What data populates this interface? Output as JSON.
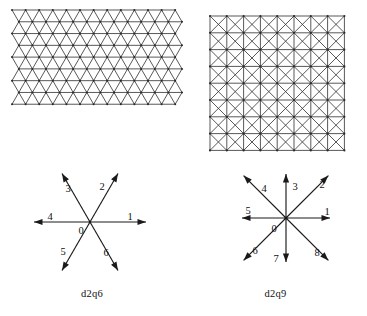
{
  "figure": {
    "title": "",
    "background_color": "#ffffff",
    "line_color": "#3a3a3a",
    "arrow_color": "#1a1a1a",
    "text_color": "#101010"
  },
  "panels": [
    {
      "id": "triangular-lattice",
      "kind": "lattice",
      "lattice_type": "triangular",
      "caption": "",
      "columns": 12,
      "rows": 8,
      "description": "triangular (hexagonal) lattice grid"
    },
    {
      "id": "square-lattice",
      "kind": "lattice",
      "lattice_type": "square-with-diagonals",
      "caption": "",
      "columns": 8,
      "rows": 8,
      "description": "square lattice grid with both diagonals per cell"
    }
  ],
  "d2q6": {
    "caption": "d2q6",
    "center_label": "0",
    "directions": [
      {
        "label": "1",
        "angle_deg": 0,
        "length": "short",
        "lx": 124,
        "ly": 58
      },
      {
        "label": "2",
        "angle_deg": 60,
        "length": "short",
        "lx": 96,
        "ly": 28
      },
      {
        "label": "3",
        "angle_deg": 120,
        "length": "short",
        "lx": 62,
        "ly": 30
      },
      {
        "label": "4",
        "angle_deg": 180,
        "length": "short",
        "lx": 44,
        "ly": 58
      },
      {
        "label": "5",
        "angle_deg": 240,
        "length": "short",
        "lx": 57,
        "ly": 93
      },
      {
        "label": "6",
        "angle_deg": 300,
        "length": "short",
        "lx": 100,
        "ly": 94
      }
    ]
  },
  "d2q9": {
    "caption": "d2q9",
    "center_label": "0",
    "directions": [
      {
        "label": "1",
        "angle_deg": 0,
        "length": "axis",
        "lx": 121,
        "ly": 53
      },
      {
        "label": "2",
        "angle_deg": 45,
        "length": "diagonal",
        "lx": 116,
        "ly": 26
      },
      {
        "label": "3",
        "angle_deg": 90,
        "length": "axis",
        "lx": 89,
        "ly": 28
      },
      {
        "label": "4",
        "angle_deg": 135,
        "length": "diagonal",
        "lx": 58,
        "ly": 30
      },
      {
        "label": "5",
        "angle_deg": 180,
        "length": "axis",
        "lx": 42,
        "ly": 52
      },
      {
        "label": "6",
        "angle_deg": 225,
        "length": "diagonal",
        "lx": 49,
        "ly": 92
      },
      {
        "label": "7",
        "angle_deg": 270,
        "length": "axis",
        "lx": 70,
        "ly": 100
      },
      {
        "label": "8",
        "angle_deg": 315,
        "length": "diagonal",
        "lx": 111,
        "ly": 94
      }
    ]
  }
}
